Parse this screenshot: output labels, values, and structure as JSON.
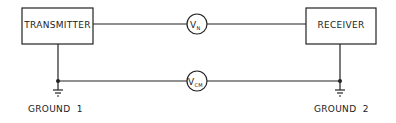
{
  "diagram": {
    "transmitter": {
      "label": "TRANSMITTER"
    },
    "receiver": {
      "label": "RECEIVER"
    },
    "vn": {
      "main": "V",
      "sub": "N"
    },
    "vcm": {
      "main": "V",
      "sub": "CM"
    },
    "ground1": {
      "label": "GROUND  1"
    },
    "ground2": {
      "label": "GROUND  2"
    },
    "colors": {
      "line": "#222222",
      "background": "#ffffff"
    }
  }
}
